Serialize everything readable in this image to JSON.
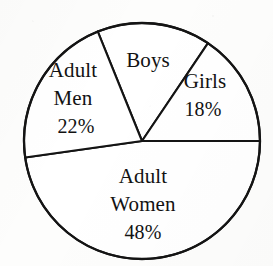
{
  "figure": {
    "name": "population-pie-chart",
    "background_color": "#fdfdfc",
    "ink_color": "#141414"
  },
  "chart_data": {
    "type": "pie",
    "title": "",
    "subtitle": "",
    "xlabel": "",
    "ylabel": "",
    "legend_position": "none",
    "grid": false,
    "labels_inside_slices": true,
    "categories": [
      "Boys",
      "Girls",
      "Adult Women",
      "Adult Men"
    ],
    "values": [
      12,
      18,
      48,
      22
    ],
    "value_unit": "%",
    "displayed_value_labels": [
      "",
      "18%",
      "48%",
      "22%"
    ],
    "slices": [
      {
        "key": "boys",
        "label": "Boys",
        "value_label": "",
        "value": 12,
        "start_angle_deg": 56,
        "end_angle_deg": 112,
        "label_x": 148,
        "label_y": 62,
        "fill": "#ffffff"
      },
      {
        "key": "girls",
        "label": "Girls",
        "value_label": "18%",
        "value": 18,
        "start_angle_deg": 0,
        "end_angle_deg": 56,
        "label_x": 205,
        "label_y": 83,
        "value_x": 203,
        "value_y": 111,
        "fill": "#ffffff"
      },
      {
        "key": "adult-women",
        "label": "Adult Women",
        "label_line_1": "Adult",
        "label_line_2": "Women",
        "value_label": "48%",
        "value": 48,
        "start_angle_deg": 188,
        "end_angle_deg": 360,
        "label_x": 143,
        "label_y": 178,
        "label2_x": 143,
        "label2_y": 206,
        "value_x": 143,
        "value_y": 234,
        "fill": "#ffffff"
      },
      {
        "key": "adult-men",
        "label": "Adult Men",
        "label_line_1": "Adult",
        "label_line_2": "Men",
        "value_label": "22%",
        "value": 22,
        "start_angle_deg": 112,
        "end_angle_deg": 188,
        "label_x": 73,
        "label_y": 72,
        "label2_x": 73,
        "label2_y": 100,
        "value_x": 76,
        "value_y": 128,
        "fill": "#ffffff"
      }
    ],
    "geometry": {
      "center_x": 142,
      "center_y": 141,
      "radius": 118
    }
  }
}
